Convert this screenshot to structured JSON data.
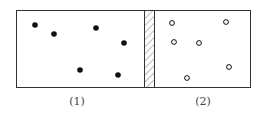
{
  "diagram": {
    "container": {
      "x": 16,
      "y": 10,
      "width": 235,
      "height": 78,
      "stroke": "#333333"
    },
    "partition": {
      "x": 144,
      "width": 10,
      "pattern": "diagonal-hatch"
    },
    "chambers": [
      {
        "label": "(1)",
        "label_x": 77,
        "particle_style": "filled",
        "color": "#111111",
        "particles": [
          [
            35,
            25
          ],
          [
            54,
            34
          ],
          [
            96,
            28
          ],
          [
            124,
            43
          ],
          [
            80,
            70
          ],
          [
            118,
            75
          ]
        ]
      },
      {
        "label": "(2)",
        "label_x": 203,
        "particle_style": "hollow",
        "color": "#111111",
        "particles": [
          [
            172,
            23
          ],
          [
            226,
            22
          ],
          [
            174,
            42
          ],
          [
            199,
            43
          ],
          [
            229,
            67
          ],
          [
            187,
            78
          ]
        ]
      }
    ]
  }
}
